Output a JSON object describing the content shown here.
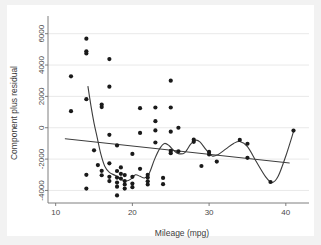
{
  "chart_data": {
    "type": "scatter",
    "title": "",
    "xlabel": "Mileage (mpg)",
    "ylabel": "Component plus residual",
    "xlim": [
      9.0,
      42.5
    ],
    "ylim": [
      -4800,
      7000
    ],
    "xticks": [
      10,
      20,
      30,
      40
    ],
    "xticklabels": [
      "10",
      "20",
      "30",
      "40"
    ],
    "yticks": [
      -4000,
      -2000,
      0,
      2000,
      4000,
      6000
    ],
    "yticklabels": [
      "-4000",
      "-2000",
      "0",
      "2000",
      "4000",
      "6000"
    ],
    "grid": "horizontal",
    "legend": "none",
    "marker_color": "#1a1a1a",
    "line_color": "#3c3c3c",
    "plot_bg": "#ffffff",
    "figure_bg": "#f2f2f2",
    "points": [
      [
        12.0,
        3280
      ],
      [
        12.0,
        1060
      ],
      [
        14.0,
        5680
      ],
      [
        14.0,
        4880
      ],
      [
        14.0,
        4740
      ],
      [
        14.0,
        1820
      ],
      [
        14.0,
        -3000
      ],
      [
        14.0,
        -3880
      ],
      [
        15.0,
        -1440
      ],
      [
        15.5,
        -2380
      ],
      [
        16.0,
        1480
      ],
      [
        16.0,
        1320
      ],
      [
        16.0,
        -2750
      ],
      [
        16.0,
        -3030
      ],
      [
        17.0,
        4380
      ],
      [
        17.0,
        2620
      ],
      [
        17.0,
        -450
      ],
      [
        17.0,
        -2270
      ],
      [
        17.0,
        -3130
      ],
      [
        17.0,
        -3400
      ],
      [
        18.0,
        -1130
      ],
      [
        18.0,
        -2760
      ],
      [
        18.0,
        -3180
      ],
      [
        18.0,
        -3500
      ],
      [
        18.0,
        -3760
      ],
      [
        18.0,
        -4320
      ],
      [
        18.5,
        -2530
      ],
      [
        18.5,
        -2940
      ],
      [
        18.5,
        -3240
      ],
      [
        19.0,
        -3020
      ],
      [
        19.0,
        -3400
      ],
      [
        19.0,
        -3620
      ],
      [
        19.0,
        -3880
      ],
      [
        20.0,
        -1670
      ],
      [
        20.0,
        -3130
      ],
      [
        20.0,
        -3560
      ],
      [
        20.0,
        -3790
      ],
      [
        21.0,
        1250
      ],
      [
        21.0,
        -330
      ],
      [
        21.0,
        -2620
      ],
      [
        22.0,
        -3000
      ],
      [
        22.0,
        -3180
      ],
      [
        22.0,
        -3420
      ],
      [
        22.0,
        -3620
      ],
      [
        23.0,
        1290
      ],
      [
        23.0,
        420
      ],
      [
        23.0,
        -170
      ],
      [
        23.0,
        -940
      ],
      [
        24.0,
        -3200
      ],
      [
        24.0,
        -3600
      ],
      [
        25.0,
        3000
      ],
      [
        25.0,
        1290
      ],
      [
        25.0,
        -250
      ],
      [
        25.0,
        -1480
      ],
      [
        25.0,
        -1620
      ],
      [
        26.0,
        0
      ],
      [
        26.0,
        -1500
      ],
      [
        28.0,
        -760
      ],
      [
        28.0,
        -900
      ],
      [
        29.0,
        -2440
      ],
      [
        30.0,
        -1540
      ],
      [
        30.0,
        -1700
      ],
      [
        31.0,
        -2160
      ],
      [
        34.0,
        -780
      ],
      [
        35.0,
        -1020
      ],
      [
        35.0,
        -1920
      ],
      [
        38.0,
        -3460
      ],
      [
        41.0,
        -180
      ]
    ],
    "regression_line": {
      "name": "linear fit",
      "x": [
        11.2,
        40.5
      ],
      "y": [
        -700,
        -2250
      ]
    },
    "lowess_curve": {
      "name": "lowess smoother",
      "x": [
        14.2,
        14.6,
        15.0,
        15.4,
        15.9,
        16.4,
        17.0,
        17.8,
        18.6,
        19.2,
        19.8,
        20.4,
        21.0,
        21.6,
        22.2,
        22.9,
        23.6,
        24.2,
        24.8,
        25.4,
        26.0,
        26.8,
        27.6,
        28.2,
        28.8,
        29.6,
        30.4,
        31.2,
        32.2,
        33.2,
        34.0,
        35.0,
        36.2,
        37.4,
        38.2,
        39.0,
        40.0,
        41.0
      ],
      "y": [
        2650,
        1400,
        300,
        -600,
        -1700,
        -2450,
        -2850,
        -3050,
        -3320,
        -3400,
        -3280,
        -3000,
        -3100,
        -3200,
        -2900,
        -2000,
        -1300,
        -1000,
        -1150,
        -1450,
        -1650,
        -1600,
        -1050,
        -800,
        -900,
        -1400,
        -1800,
        -1700,
        -1350,
        -1000,
        -880,
        -1200,
        -2200,
        -3150,
        -3500,
        -3100,
        -1800,
        -250
      ]
    }
  }
}
